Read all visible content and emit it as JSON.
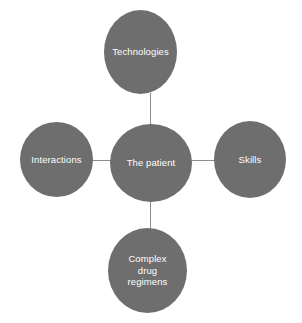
{
  "diagram": {
    "type": "concept-map",
    "layout": "radial hub-and-spoke",
    "background_color": "#ffffff",
    "node_fill_color": "#6e6e6e",
    "node_text_color": "#ffffff",
    "connector_color": "#8d8d8d",
    "center": {
      "id": "center",
      "label": "The patient"
    },
    "satellites": [
      {
        "id": "top",
        "label": "Technologies",
        "position": "top"
      },
      {
        "id": "left",
        "label": "Interactions",
        "position": "left"
      },
      {
        "id": "right",
        "label": "Skills",
        "position": "right"
      },
      {
        "id": "bottom",
        "label": "Complex\ndrug\nregimens",
        "position": "bottom"
      }
    ],
    "connectors": [
      {
        "id": "top",
        "from": "center",
        "to": "top"
      },
      {
        "id": "bottom",
        "from": "center",
        "to": "bottom"
      },
      {
        "id": "left",
        "from": "center",
        "to": "left"
      },
      {
        "id": "right",
        "from": "center",
        "to": "right"
      }
    ],
    "caption_remnant": {
      "fragment_1": "",
      "fragment_2": "",
      "fragment_3": ""
    }
  }
}
